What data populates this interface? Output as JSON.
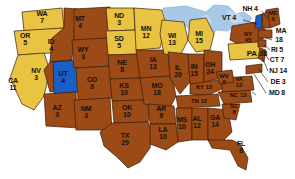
{
  "map": {
    "title": "United States Electoral Vote Map",
    "background_color": "#ffffff",
    "water_color": "#a8c8e8",
    "border_color": "#3a1d0a",
    "category_colors": {
      "brown": "#9c4a16",
      "gold": "#e8c442",
      "blue": "#1a5fc8"
    },
    "legend_note": "State abbreviation with electoral vote count"
  },
  "states": [
    {
      "id": "WA",
      "name": "WA",
      "ev": "7",
      "color": "gold",
      "x": 42,
      "y": 18,
      "size": "s7",
      "inline": false
    },
    {
      "id": "OR",
      "name": "OR",
      "ev": "5",
      "color": "gold",
      "x": 25,
      "y": 40,
      "size": "s7",
      "inline": false
    },
    {
      "id": "CA",
      "name": "CA",
      "ev": "11",
      "color": "gold",
      "x": 13,
      "y": 85,
      "size": "s7",
      "inline": false
    },
    {
      "id": "ID",
      "name": "ID",
      "ev": "4",
      "color": "brown",
      "x": 51,
      "y": 46,
      "size": "s7",
      "inline": false
    },
    {
      "id": "NV",
      "name": "NV",
      "ev": "3",
      "color": "brown",
      "x": 36,
      "y": 75,
      "size": "s7",
      "inline": false
    },
    {
      "id": "UT",
      "name": "UT",
      "ev": "4",
      "color": "blue",
      "x": 63,
      "y": 78,
      "size": "s7",
      "inline": false
    },
    {
      "id": "AZ",
      "name": "AZ",
      "ev": "3",
      "color": "brown",
      "x": 57,
      "y": 112,
      "size": "s7",
      "inline": false
    },
    {
      "id": "MT",
      "name": "MT",
      "ev": "4",
      "color": "brown",
      "x": 80,
      "y": 23,
      "size": "s7",
      "inline": false
    },
    {
      "id": "WY",
      "name": "WY",
      "ev": "3",
      "color": "brown",
      "x": 83,
      "y": 54,
      "size": "s7",
      "inline": false
    },
    {
      "id": "CO",
      "name": "CO",
      "ev": "8",
      "color": "brown",
      "x": 92,
      "y": 84,
      "size": "s7",
      "inline": false
    },
    {
      "id": "NM",
      "name": "NM",
      "ev": "3",
      "color": "brown",
      "x": 86,
      "y": 113,
      "size": "s7",
      "inline": false
    },
    {
      "id": "ND",
      "name": "ND",
      "ev": "3",
      "color": "gold",
      "x": 119,
      "y": 20,
      "size": "s7",
      "inline": false
    },
    {
      "id": "SD",
      "name": "SD",
      "ev": "5",
      "color": "gold",
      "x": 119,
      "y": 43,
      "size": "s7",
      "inline": false
    },
    {
      "id": "NE",
      "name": "NE",
      "ev": "8",
      "color": "brown",
      "x": 122,
      "y": 67,
      "size": "s7",
      "inline": false
    },
    {
      "id": "KS",
      "name": "KS",
      "ev": "10",
      "color": "brown",
      "x": 124,
      "y": 90,
      "size": "s7",
      "inline": false
    },
    {
      "id": "OK",
      "name": "OK",
      "ev": "10",
      "color": "brown",
      "x": 127,
      "y": 112,
      "size": "s7",
      "inline": false
    },
    {
      "id": "TX",
      "name": "TX",
      "ev": "29",
      "color": "brown",
      "x": 125,
      "y": 140,
      "size": "s7",
      "inline": false
    },
    {
      "id": "MN",
      "name": "MN",
      "ev": "12",
      "color": "gold",
      "x": 146,
      "y": 33,
      "size": "s7",
      "inline": false
    },
    {
      "id": "IA",
      "name": "IA",
      "ev": "13",
      "color": "brown",
      "x": 153,
      "y": 64,
      "size": "s7",
      "inline": false
    },
    {
      "id": "MO",
      "name": "MO",
      "ev": "18",
      "color": "brown",
      "x": 157,
      "y": 90,
      "size": "s7",
      "inline": false
    },
    {
      "id": "AR",
      "name": "AR",
      "ev": "9",
      "color": "brown",
      "x": 161,
      "y": 113,
      "size": "s7",
      "inline": false
    },
    {
      "id": "LA",
      "name": "LA",
      "ev": "10",
      "color": "brown",
      "x": 163,
      "y": 134,
      "size": "s7",
      "inline": false
    },
    {
      "id": "WI",
      "name": "WI",
      "ev": "13",
      "color": "gold",
      "x": 172,
      "y": 40,
      "size": "s7",
      "inline": false
    },
    {
      "id": "IL",
      "name": "IL",
      "ev": "20",
      "color": "brown",
      "x": 178,
      "y": 72,
      "size": "s7",
      "inline": false
    },
    {
      "id": "MS",
      "name": "MS",
      "ev": "10",
      "color": "brown",
      "x": 182,
      "y": 124,
      "size": "s7",
      "inline": false
    },
    {
      "id": "MI",
      "name": "MI",
      "ev": "15",
      "color": "gold",
      "x": 199,
      "y": 38,
      "size": "s7",
      "inline": false
    },
    {
      "id": "IN",
      "name": "IN",
      "ev": "15",
      "color": "brown",
      "x": 194,
      "y": 71,
      "size": "s7",
      "inline": false
    },
    {
      "id": "AL",
      "name": "AL",
      "ev": "12",
      "color": "brown",
      "x": 197,
      "y": 123,
      "size": "s7",
      "inline": false
    },
    {
      "id": "OH",
      "name": "OH",
      "ev": "24",
      "color": "brown",
      "x": 210,
      "y": 69,
      "size": "s7",
      "inline": false
    },
    {
      "id": "KY",
      "name": "KY",
      "ev": "12",
      "color": "brown",
      "x": 204,
      "y": 88,
      "size": "s6",
      "inline": true
    },
    {
      "id": "TN",
      "name": "TN",
      "ev": "12",
      "color": "brown",
      "x": 199,
      "y": 102,
      "size": "s6",
      "inline": true
    },
    {
      "id": "GA",
      "name": "GA",
      "ev": "14",
      "color": "brown",
      "x": 215,
      "y": 122,
      "size": "s7",
      "inline": false
    },
    {
      "id": "FL",
      "name": "FL",
      "ev": "8",
      "color": "brown",
      "x": 241,
      "y": 148,
      "size": "s7",
      "inline": false
    },
    {
      "id": "WV",
      "name": "WV",
      "ev": "6",
      "color": "brown",
      "x": 224,
      "y": 80,
      "size": "s6",
      "inline": false
    },
    {
      "id": "VA",
      "name": "VA",
      "ev": "12",
      "color": "brown",
      "x": 239,
      "y": 83,
      "size": "s6",
      "inline": false
    },
    {
      "id": "SC",
      "name": "SC",
      "ev": "8",
      "color": "brown",
      "x": 234,
      "y": 110,
      "size": "s6",
      "inline": false
    },
    {
      "id": "NC",
      "name": "NC",
      "ev": "13",
      "color": "brown",
      "x": 238,
      "y": 96,
      "size": "s6",
      "inline": true
    },
    {
      "id": "NY",
      "name": "NY",
      "ev": "45",
      "color": "brown",
      "x": 248,
      "y": 38,
      "size": "s6",
      "inline": false
    },
    {
      "id": "PA",
      "name": "PA",
      "ev": "38",
      "color": "gold",
      "x": 257,
      "y": 54,
      "size": "s8",
      "inline": true
    },
    {
      "id": "ME",
      "name": "ME",
      "ev": "6",
      "color": "brown",
      "x": 273,
      "y": 17,
      "size": "s6",
      "inline": false
    }
  ],
  "callouts": [
    {
      "id": "NH",
      "label": "NH 4",
      "x": 250,
      "y": 9,
      "anchor_x": 268,
      "anchor_y": 19
    },
    {
      "id": "VT",
      "label": "VT 4",
      "x": 229,
      "y": 18,
      "anchor_x": 258,
      "anchor_y": 24
    },
    {
      "id": "MA",
      "label": "MA",
      "x": 281,
      "y": 31,
      "anchor_x": 268,
      "anchor_y": 37
    },
    {
      "id": "MA_EV",
      "label": "18",
      "x": 279,
      "y": 40,
      "anchor_x": 268,
      "anchor_y": 40
    },
    {
      "id": "RI",
      "label": "RI 5",
      "x": 277,
      "y": 50,
      "anchor_x": 266,
      "anchor_y": 45
    },
    {
      "id": "CT",
      "label": "CT 7",
      "x": 277,
      "y": 60,
      "anchor_x": 263,
      "anchor_y": 49
    },
    {
      "id": "NJ",
      "label": "NJ 14",
      "x": 278,
      "y": 71,
      "anchor_x": 262,
      "anchor_y": 57
    },
    {
      "id": "DE",
      "label": "DE 3",
      "x": 278,
      "y": 82,
      "anchor_x": 259,
      "anchor_y": 66
    },
    {
      "id": "MD",
      "label": "MD 8",
      "x": 277,
      "y": 93,
      "anchor_x": 255,
      "anchor_y": 73
    }
  ]
}
